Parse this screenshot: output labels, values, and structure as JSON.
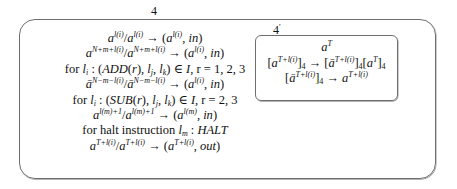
{
  "diagram": {
    "outer_membrane": {
      "label": "4",
      "rules": [
        "a^{l(i)}/a^{l(i)} → (a^{l(i)}, in)",
        "a^{N+m+l(i)}/a^{N+m+l(i)} → (a^{l(i)}, in)",
        "for l_i : (ADD(r), l_j, l_k) ∈ I, r = 1, 2, 3",
        "ā^{N−m−l(i)}/ā^{N−m−l(i)} → (a^{l(i)}, in)",
        "for l_i : (SUB(r), l_j, l_k) ∈ I, r = 2, 3",
        "a^{l(m)+1}/a^{l(m)+1} → (a^{l(m)}, in)",
        "for halt instruction l_m : HALT",
        "a^{T+l(i)}/a^{T+l(i)} → (a^{T+l(i)}, out)"
      ]
    },
    "inner_membrane": {
      "label": "4",
      "label_prime": "′",
      "contents": [
        "a^T",
        "[a^{T+l(i)}]_4 → [ā^{T+l(i)}]_4[a^T]_4",
        "[ā^{T+l(i)}]_4 → a^{T+l(i)}"
      ]
    },
    "tokens": {
      "a": "a",
      "abar": "ā",
      "arrow": "→",
      "slash": "/",
      "in": "in",
      "out": "out",
      "li": "l(i)",
      "lm": "l(m)",
      "NmLi": "N+m+l(i)",
      "NminusLi": "N−m−l(i)",
      "lm1": "l(m)+1",
      "T": "T",
      "TLi": "T+l(i)",
      "four": "4",
      "for": "for",
      "for_halt": "for halt instruction",
      "add": "ADD",
      "sub": "SUB",
      "halt": "HALT",
      "I": "I",
      "r_add": "r = 1, 2, 3",
      "r_sub": "r = 2, 3"
    }
  }
}
